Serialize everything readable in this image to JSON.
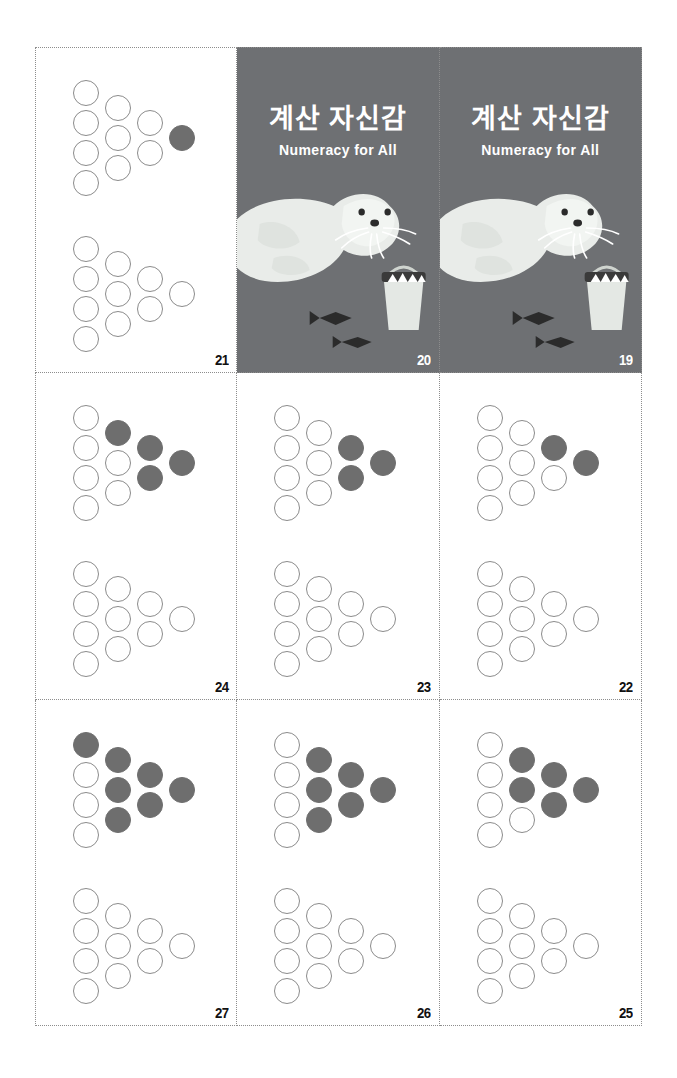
{
  "page": {
    "sheet_label": "numeracy-flashcard-sheet",
    "background_color": "#ffffff",
    "cut_line_color": "#8d8d8d"
  },
  "colors": {
    "cover_background": "#6e7073",
    "filled_dot": "#6e6e6e",
    "open_dot_stroke": "#8b8b8b",
    "page_number": "#111111",
    "cover_text": "#ffffff",
    "seal_body": "#e9ece9",
    "fish_dark": "#2b2b2b"
  },
  "cover": {
    "title": "계산 자신감",
    "subtitle": "Numeracy for All",
    "art_name": "seal-with-fish-bucket-illustration"
  },
  "cards": [
    {
      "number": "21",
      "type": "dots",
      "columns": [
        {
          "total": 4,
          "filled": 0
        },
        {
          "total": 3,
          "filled": 0
        },
        {
          "total": 2,
          "filled": 0
        },
        {
          "total": 1,
          "filled": 1
        }
      ],
      "bottom_columns": [
        {
          "total": 4,
          "filled": 0
        },
        {
          "total": 3,
          "filled": 0
        },
        {
          "total": 2,
          "filled": 0
        },
        {
          "total": 1,
          "filled": 0
        }
      ],
      "filled_count": 1
    },
    {
      "number": "20",
      "type": "cover"
    },
    {
      "number": "19",
      "type": "cover"
    },
    {
      "number": "24",
      "type": "dots",
      "columns": [
        {
          "total": 4,
          "filled": 0
        },
        {
          "total": 3,
          "filled": 1
        },
        {
          "total": 2,
          "filled": 2
        },
        {
          "total": 1,
          "filled": 1
        }
      ],
      "bottom_columns": [
        {
          "total": 4,
          "filled": 0
        },
        {
          "total": 3,
          "filled": 0
        },
        {
          "total": 2,
          "filled": 0
        },
        {
          "total": 1,
          "filled": 0
        }
      ],
      "filled_count": 4
    },
    {
      "number": "23",
      "type": "dots",
      "columns": [
        {
          "total": 4,
          "filled": 0
        },
        {
          "total": 3,
          "filled": 0
        },
        {
          "total": 2,
          "filled": 2
        },
        {
          "total": 1,
          "filled": 1
        }
      ],
      "bottom_columns": [
        {
          "total": 4,
          "filled": 0
        },
        {
          "total": 3,
          "filled": 0
        },
        {
          "total": 2,
          "filled": 0
        },
        {
          "total": 1,
          "filled": 0
        }
      ],
      "filled_count": 3
    },
    {
      "number": "22",
      "type": "dots",
      "columns": [
        {
          "total": 4,
          "filled": 0
        },
        {
          "total": 3,
          "filled": 0
        },
        {
          "total": 2,
          "filled": 1
        },
        {
          "total": 1,
          "filled": 1
        }
      ],
      "bottom_columns": [
        {
          "total": 4,
          "filled": 0
        },
        {
          "total": 3,
          "filled": 0
        },
        {
          "total": 2,
          "filled": 0
        },
        {
          "total": 1,
          "filled": 0
        }
      ],
      "filled_count": 2
    },
    {
      "number": "27",
      "type": "dots",
      "columns": [
        {
          "total": 4,
          "filled": 1
        },
        {
          "total": 3,
          "filled": 3
        },
        {
          "total": 2,
          "filled": 2
        },
        {
          "total": 1,
          "filled": 1
        }
      ],
      "bottom_columns": [
        {
          "total": 4,
          "filled": 0
        },
        {
          "total": 3,
          "filled": 0
        },
        {
          "total": 2,
          "filled": 0
        },
        {
          "total": 1,
          "filled": 0
        }
      ],
      "filled_count": 7
    },
    {
      "number": "26",
      "type": "dots",
      "columns": [
        {
          "total": 4,
          "filled": 0
        },
        {
          "total": 3,
          "filled": 3
        },
        {
          "total": 2,
          "filled": 2
        },
        {
          "total": 1,
          "filled": 1
        }
      ],
      "bottom_columns": [
        {
          "total": 4,
          "filled": 0
        },
        {
          "total": 3,
          "filled": 0
        },
        {
          "total": 2,
          "filled": 0
        },
        {
          "total": 1,
          "filled": 0
        }
      ],
      "filled_count": 6
    },
    {
      "number": "25",
      "type": "dots",
      "columns": [
        {
          "total": 4,
          "filled": 0
        },
        {
          "total": 3,
          "filled": 2
        },
        {
          "total": 2,
          "filled": 2
        },
        {
          "total": 1,
          "filled": 1
        }
      ],
      "bottom_columns": [
        {
          "total": 4,
          "filled": 0
        },
        {
          "total": 3,
          "filled": 0
        },
        {
          "total": 2,
          "filled": 0
        },
        {
          "total": 1,
          "filled": 0
        }
      ],
      "filled_count": 5
    }
  ]
}
